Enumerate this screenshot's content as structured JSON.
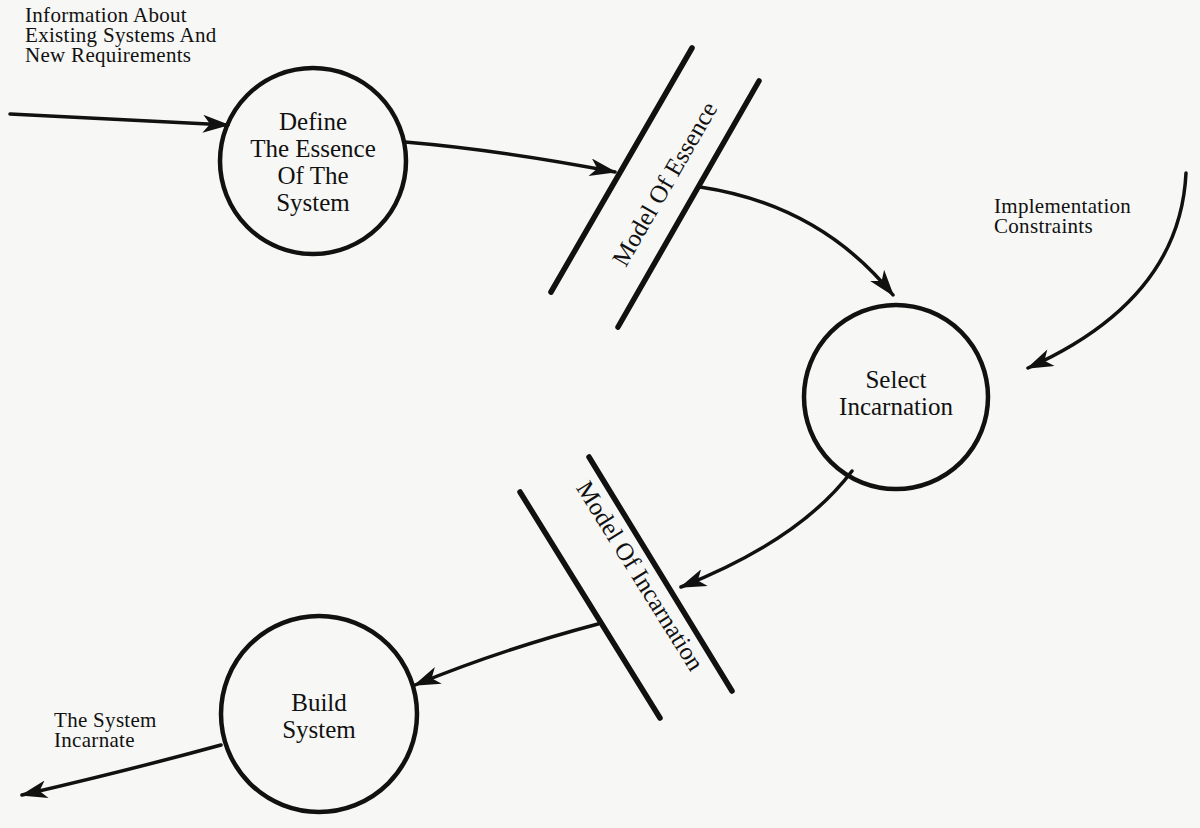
{
  "diagram": {
    "type": "data-flow-diagram",
    "processes": [
      {
        "id": "define",
        "label": "Define\nThe Essence\nOf The\nSystem"
      },
      {
        "id": "select",
        "label": "Select\nIncarnation"
      },
      {
        "id": "build",
        "label": "Build\nSystem"
      }
    ],
    "stores": [
      {
        "id": "essence",
        "label": "Model Of Essence"
      },
      {
        "id": "incarnation",
        "label": "Model Of Incarnation"
      }
    ],
    "flows": [
      {
        "from": "external",
        "to": "define",
        "label": "Information About\nExisting Systems And\nNew Requirements"
      },
      {
        "from": "define",
        "to": "essence",
        "label": ""
      },
      {
        "from": "essence",
        "to": "select",
        "label": ""
      },
      {
        "from": "external",
        "to": "select",
        "label": "Implementation\nConstraints"
      },
      {
        "from": "select",
        "to": "incarnation",
        "label": ""
      },
      {
        "from": "incarnation",
        "to": "build",
        "label": ""
      },
      {
        "from": "build",
        "to": "external",
        "label": "The System\nIncarnate"
      }
    ],
    "colors": {
      "ink": "#111111",
      "paper": "#f7f7f5"
    }
  }
}
